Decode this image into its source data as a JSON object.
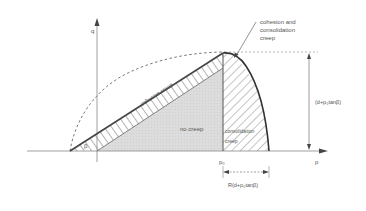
{
  "diagram": {
    "axes": {
      "x_label": "p",
      "y_label": "q"
    },
    "labels": {
      "cohesion_consolidation_line1": "cohesion and",
      "cohesion_consolidation_line2": "consolidation",
      "cohesion_consolidation_line3": "creep",
      "cohesion_creep": "cohesion creep",
      "no_creep": "no creep",
      "consolidation_creep_line1": "consolidation",
      "consolidation_creep_line2": "creep",
      "beta": "β",
      "p0": "p₀",
      "vertical_dimension": "(d+p₀tanβ)",
      "horizontal_dimension": "R(d+p₀tanβ)"
    },
    "colors": {
      "line": "#444444",
      "no_creep_fill": "#d9d9d9",
      "hatch": "#888888",
      "dashed": "#666666",
      "text": "#555555"
    }
  }
}
